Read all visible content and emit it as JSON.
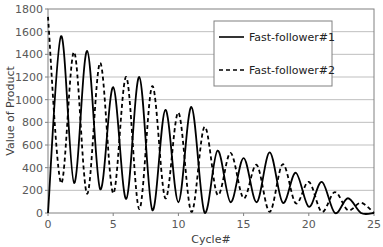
{
  "chart_data": {
    "type": "line",
    "title": "",
    "xlabel": "Cycle#",
    "ylabel": "Value of Product",
    "xlim": [
      0,
      25
    ],
    "ylim": [
      0,
      1800
    ],
    "xticks": [
      0,
      5,
      10,
      15,
      20,
      25
    ],
    "yticks": [
      0,
      200,
      400,
      600,
      800,
      1000,
      1200,
      1400,
      1600,
      1800
    ],
    "grid": "horizontal",
    "legend_position": "upper right",
    "x": [
      0,
      1,
      2,
      3,
      4,
      5,
      6,
      7,
      8,
      9,
      10,
      11,
      12,
      13,
      14,
      15,
      16,
      17,
      18,
      19,
      20,
      21,
      22,
      23,
      24,
      25
    ],
    "series": [
      {
        "name": "Fast-follower#1",
        "style": "solid",
        "values": [
          0,
          1560,
          265,
          1430,
          210,
          1110,
          125,
          1200,
          25,
          910,
          95,
          935,
          5,
          550,
          95,
          485,
          95,
          535,
          90,
          355,
          55,
          275,
          0,
          130,
          0,
          0
        ]
      },
      {
        "name": "Fast-follower#2",
        "style": "dashed",
        "values": [
          1730,
          265,
          1420,
          170,
          1325,
          175,
          1200,
          35,
          1120,
          130,
          885,
          10,
          760,
          160,
          530,
          130,
          425,
          10,
          430,
          85,
          275,
          10,
          185,
          25,
          90,
          0
        ]
      }
    ]
  },
  "colors": {
    "line": "#000000",
    "grid": "#bfbfbf",
    "axis": "#808080",
    "tick_text": "#595959"
  },
  "legend": {
    "items": [
      "Fast-follower#1",
      "Fast-follower#2"
    ]
  }
}
